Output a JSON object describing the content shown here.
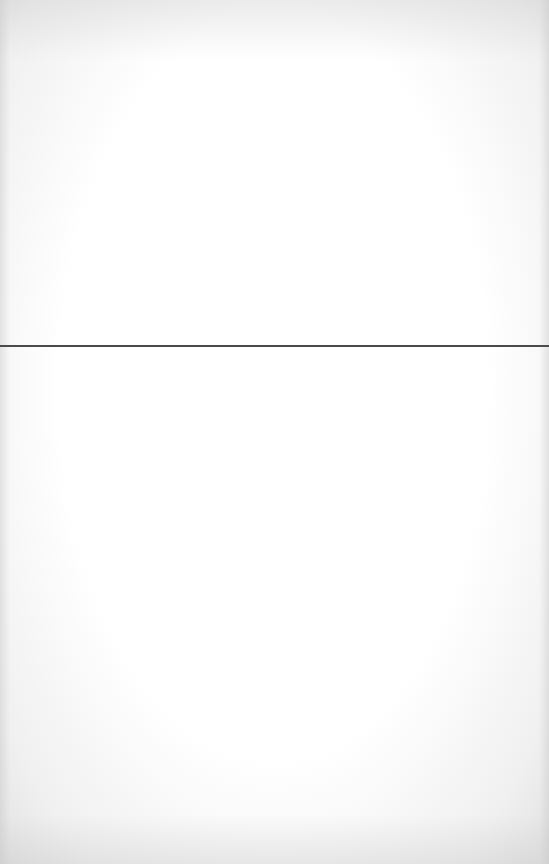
{
  "page": {
    "type": "blank-scanned-page",
    "background_color": "#fdfdfd"
  },
  "divider": {
    "color": "#4a4a4a",
    "position_y": 345,
    "thickness": 2
  }
}
